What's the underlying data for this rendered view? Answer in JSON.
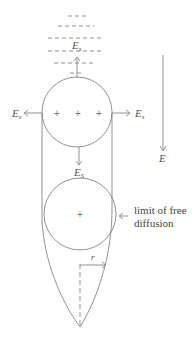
{
  "diagram": {
    "labels": {
      "top_field": {
        "main": "E",
        "sub": "s"
      },
      "left_field": {
        "main": "E",
        "sub": "s"
      },
      "right_field": {
        "main": "E",
        "sub": "s"
      },
      "down_field": {
        "main": "E",
        "sub": "S"
      },
      "external_field": "E",
      "radius": "r",
      "limit_line1": "limit of free",
      "limit_line2": "diffusion",
      "plus_sign": "+"
    },
    "colors": {
      "stroke": "#666666",
      "text": "#555555"
    }
  }
}
